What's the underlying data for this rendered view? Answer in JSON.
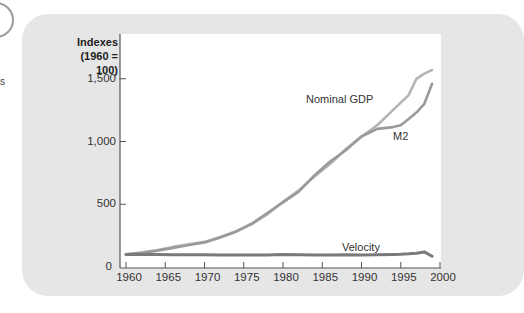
{
  "side": {
    "fragment_text": "s"
  },
  "chart_data": {
    "type": "line",
    "title": "",
    "ylabel_line1": "Indexes",
    "ylabel_line2": "(1960 = 100)",
    "xlabel": "",
    "xlim": [
      1960,
      2000
    ],
    "ylim": [
      0,
      1700
    ],
    "grid": false,
    "legend": "inline labels",
    "x_ticks": [
      "1960",
      "1965",
      "1970",
      "1975",
      "1980",
      "1985",
      "1990",
      "1995",
      "2000"
    ],
    "y_ticks": [
      "0",
      "500",
      "1,000",
      "1,500"
    ],
    "x": [
      1960,
      1962,
      1964,
      1966,
      1968,
      1970,
      1972,
      1974,
      1976,
      1978,
      1980,
      1982,
      1984,
      1986,
      1988,
      1990,
      1992,
      1994,
      1995,
      1996,
      1997,
      1998,
      1999
    ],
    "series": [
      {
        "name": "Nominal GDP",
        "label": "Nominal GDP",
        "color": "#b5b5b5",
        "values": [
          100,
          115,
          135,
          160,
          180,
          200,
          240,
          285,
          340,
          420,
          520,
          610,
          720,
          820,
          940,
          1040,
          1130,
          1250,
          1310,
          1370,
          1500,
          1540,
          1570
        ]
      },
      {
        "name": "M2",
        "label": "M2",
        "color": "#9a9a9a",
        "values": [
          100,
          112,
          130,
          152,
          175,
          195,
          235,
          280,
          345,
          430,
          515,
          600,
          730,
          840,
          930,
          1040,
          1100,
          1115,
          1130,
          1180,
          1230,
          1300,
          1460
        ]
      },
      {
        "name": "Velocity",
        "label": "Velocity",
        "color": "#7a7a7a",
        "values": [
          100,
          100,
          99,
          98,
          97,
          98,
          96,
          96,
          95,
          95,
          100,
          97,
          95,
          96,
          98,
          96,
          97,
          100,
          102,
          105,
          110,
          120,
          85
        ]
      }
    ]
  }
}
